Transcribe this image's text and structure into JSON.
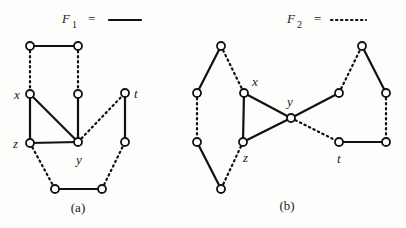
{
  "figure": {
    "legend": {
      "f1": {
        "symbol": "F",
        "subscript": "1",
        "equals": "=",
        "line_style": "solid"
      },
      "f2": {
        "symbol": "F",
        "subscript": "2",
        "equals": "=",
        "line_style": "dotted"
      }
    },
    "panels": [
      {
        "id": "a",
        "caption": "(a)",
        "nodes": [
          {
            "id": "a1",
            "x": 30,
            "y": 46,
            "label": ""
          },
          {
            "id": "a2",
            "x": 78,
            "y": 46,
            "label": ""
          },
          {
            "id": "x",
            "x": 30,
            "y": 94,
            "label": "x"
          },
          {
            "id": "a4",
            "x": 78,
            "y": 94,
            "label": ""
          },
          {
            "id": "t",
            "x": 125,
            "y": 93,
            "label": "t"
          },
          {
            "id": "z",
            "x": 30,
            "y": 143,
            "label": "z"
          },
          {
            "id": "y",
            "x": 78,
            "y": 142,
            "label": "y"
          },
          {
            "id": "a8",
            "x": 125,
            "y": 142,
            "label": ""
          },
          {
            "id": "a9",
            "x": 55,
            "y": 189,
            "label": ""
          },
          {
            "id": "a10",
            "x": 102,
            "y": 189,
            "label": ""
          }
        ],
        "edges": [
          {
            "from": "a1",
            "to": "a2",
            "style": "solid"
          },
          {
            "from": "a1",
            "to": "x",
            "style": "dotted"
          },
          {
            "from": "a2",
            "to": "a4",
            "style": "dotted"
          },
          {
            "from": "x",
            "to": "z",
            "style": "solid"
          },
          {
            "from": "x",
            "to": "y",
            "style": "solid"
          },
          {
            "from": "a4",
            "to": "y",
            "style": "solid"
          },
          {
            "from": "z",
            "to": "y",
            "style": "solid"
          },
          {
            "from": "y",
            "to": "t",
            "style": "dotted"
          },
          {
            "from": "t",
            "to": "a8",
            "style": "solid"
          },
          {
            "from": "z",
            "to": "a9",
            "style": "dotted"
          },
          {
            "from": "a9",
            "to": "a10",
            "style": "solid"
          },
          {
            "from": "a10",
            "to": "a8",
            "style": "dotted"
          }
        ],
        "labels": [
          {
            "text": "x",
            "x": 14,
            "y": 99
          },
          {
            "text": "t",
            "x": 134,
            "y": 98
          },
          {
            "text": "z",
            "x": 13,
            "y": 148
          },
          {
            "text": "y",
            "x": 76,
            "y": 164
          }
        ]
      },
      {
        "id": "b",
        "caption": "(b)",
        "nodes": [
          {
            "id": "b1",
            "x": 221,
            "y": 46,
            "label": ""
          },
          {
            "id": "b2",
            "x": 197,
            "y": 93,
            "label": ""
          },
          {
            "id": "x",
            "x": 244,
            "y": 93,
            "label": "x"
          },
          {
            "id": "y",
            "x": 291,
            "y": 118,
            "label": "y"
          },
          {
            "id": "b5",
            "x": 339,
            "y": 93,
            "label": ""
          },
          {
            "id": "b6",
            "x": 362,
            "y": 46,
            "label": ""
          },
          {
            "id": "b7",
            "x": 386,
            "y": 93,
            "label": ""
          },
          {
            "id": "b8",
            "x": 197,
            "y": 142,
            "label": ""
          },
          {
            "id": "z",
            "x": 243,
            "y": 142,
            "label": "z"
          },
          {
            "id": "t",
            "x": 339,
            "y": 142,
            "label": "t"
          },
          {
            "id": "b11",
            "x": 386,
            "y": 142,
            "label": ""
          },
          {
            "id": "b12",
            "x": 221,
            "y": 189,
            "label": ""
          }
        ],
        "edges": [
          {
            "from": "b1",
            "to": "b2",
            "style": "solid"
          },
          {
            "from": "b1",
            "to": "x",
            "style": "dotted"
          },
          {
            "from": "b2",
            "to": "b8",
            "style": "dotted"
          },
          {
            "from": "x",
            "to": "y",
            "style": "solid"
          },
          {
            "from": "x",
            "to": "z",
            "style": "solid"
          },
          {
            "from": "z",
            "to": "y",
            "style": "solid"
          },
          {
            "from": "y",
            "to": "b5",
            "style": "solid"
          },
          {
            "from": "b5",
            "to": "b6",
            "style": "dotted"
          },
          {
            "from": "b6",
            "to": "b7",
            "style": "solid"
          },
          {
            "from": "b7",
            "to": "b11",
            "style": "dotted"
          },
          {
            "from": "y",
            "to": "t",
            "style": "dotted"
          },
          {
            "from": "t",
            "to": "b11",
            "style": "solid"
          },
          {
            "from": "b8",
            "to": "b12",
            "style": "solid"
          },
          {
            "from": "z",
            "to": "b12",
            "style": "dotted"
          }
        ],
        "labels": [
          {
            "text": "x",
            "x": 252,
            "y": 86
          },
          {
            "text": "y",
            "x": 287,
            "y": 106
          },
          {
            "text": "z",
            "x": 243,
            "y": 162
          },
          {
            "text": "t",
            "x": 337,
            "y": 163
          }
        ]
      }
    ]
  }
}
